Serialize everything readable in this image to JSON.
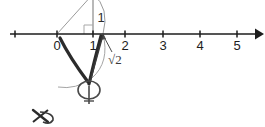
{
  "figure": {
    "background_color": "#ffffff",
    "axis_color": "#1d1d1d",
    "construction_color": "#8c8c8c",
    "annotation_color": "#2b2b2b"
  },
  "number_line": {
    "name": "number-line",
    "axis_y": 34,
    "start_x": 10,
    "end_x": 263,
    "unit_px": 31.5,
    "origin_x": 57,
    "arrow": "right-arrowhead",
    "ticks": [
      {
        "value": "",
        "x": 15,
        "label": ""
      },
      {
        "value": "0",
        "x": 57,
        "label": "0"
      },
      {
        "value": "1",
        "x": 93,
        "label": "1"
      },
      {
        "value": "2",
        "x": 125,
        "label": "2"
      },
      {
        "value": "3",
        "x": 163,
        "label": "3"
      },
      {
        "value": "4",
        "x": 200,
        "label": "4"
      },
      {
        "value": "5",
        "x": 237,
        "label": "5"
      }
    ]
  },
  "construction": {
    "description": "Right triangle with unit legs; hypotenuse rotated by an arc onto the axis at sqrt(2)",
    "apex_x": 93,
    "apex_y": -6,
    "vertical_leg_label": "1",
    "vertical_leg_label_x": 101,
    "vertical_leg_label_y": 19,
    "right_angle_marker_size": 9,
    "arc_label": "√2",
    "arc_label_x": 112,
    "arc_label_y": 62,
    "sqrt2_point_x": 101.5
  },
  "annotations": {
    "pointer_arrow": "arrow-to-sqrt2-point",
    "handdrawn_v_mark": "v-shaped-ink-mark",
    "handdrawn_loop": "circle-loop-ink-mark",
    "handdrawn_scribble": "scribble-ink-mark"
  }
}
